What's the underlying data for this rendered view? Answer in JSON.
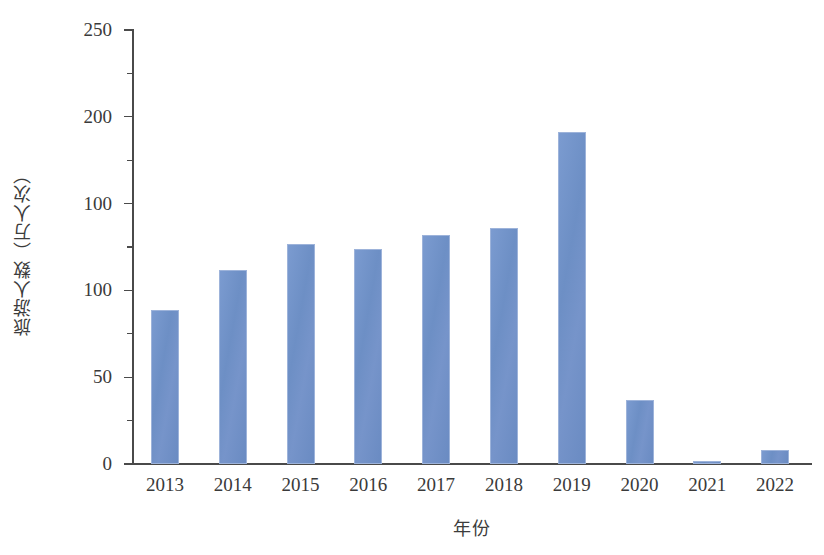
{
  "chart_data": {
    "type": "bar",
    "title": "",
    "subtitle": "",
    "xlabel": "年份",
    "ylabel": "旅游人数（万人次）",
    "categories": [
      "2013",
      "2014",
      "2015",
      "2016",
      "2017",
      "2018",
      "2019",
      "2020",
      "2021",
      "2022"
    ],
    "values": [
      89,
      112,
      127,
      124,
      132,
      136,
      191,
      37,
      2,
      8
    ],
    "series": [
      {
        "name": "旅游人数",
        "values": [
          89,
          112,
          127,
          124,
          132,
          136,
          191,
          37,
          2,
          8
        ]
      }
    ],
    "ylim": [
      0,
      250
    ],
    "y_major_ticks": [
      0,
      50,
      100,
      100,
      200,
      250
    ],
    "y_major_tick_labels": [
      "0",
      "50",
      "100",
      "100",
      "200",
      "250"
    ],
    "y_minor_ticks": [
      25,
      75,
      125,
      175,
      225
    ],
    "grid": false,
    "legend": false,
    "legend_position": "none",
    "bar_color": "#6d8fc5",
    "bar_edge_color": "#9db3da",
    "axis_color": "#4a4a4a",
    "background_color": "#ffffff",
    "annotations": []
  },
  "axes": {
    "y_title": "旅游人数（万人次）",
    "x_title": "年份",
    "y_tick_labels": [
      "250",
      "200",
      "100",
      "100",
      "50",
      "0"
    ],
    "x_tick_labels": [
      "2013",
      "2014",
      "2015",
      "2016",
      "2017",
      "2018",
      "2019",
      "2020",
      "2021",
      "2022"
    ]
  }
}
